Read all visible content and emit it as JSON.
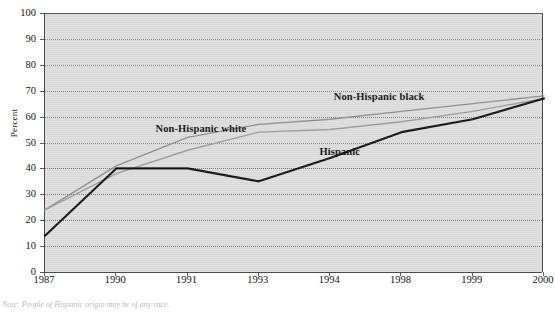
{
  "chart_data": {
    "type": "line",
    "title": "",
    "xlabel": "",
    "ylabel": "Percent",
    "ylim": [
      0,
      100
    ],
    "ytick_step": 10,
    "grid": true,
    "legend": "inline-labels",
    "categories": [
      "1987",
      "1990",
      "1991",
      "1993",
      "1994",
      "1998",
      "1999",
      "2000"
    ],
    "yticks": [
      "0",
      "10",
      "20",
      "30",
      "40",
      "50",
      "60",
      "70",
      "80",
      "90",
      "100"
    ],
    "series": [
      {
        "name": "Non-Hispanic white",
        "color": "#8c8c8c",
        "values": [
          24,
          41,
          52,
          57,
          59,
          62,
          65,
          68
        ]
      },
      {
        "name": "Non-Hispanic black",
        "color": "#9a9a9a",
        "values": [
          24,
          38,
          47,
          54,
          55,
          58,
          62,
          67
        ]
      },
      {
        "name": "Hispanic",
        "color": "#101010",
        "values": [
          14,
          40,
          40,
          35,
          44,
          54,
          59,
          67
        ]
      }
    ],
    "annotations": [
      {
        "text": "Non-Hispanic white",
        "x": 1.55,
        "y": 55
      },
      {
        "text": "Non-Hispanic black",
        "x": 4.05,
        "y": 67
      },
      {
        "text": "Hispanic",
        "x": 3.85,
        "y": 46
      }
    ]
  },
  "footnote": {
    "text": "Note: People of Hispanic origin may be of any race."
  },
  "colors": {
    "plot_background": "#dcdcdc",
    "axis": "#4a4a4a",
    "gridline": "#7e7e7e",
    "page_background": "#ffffff"
  }
}
